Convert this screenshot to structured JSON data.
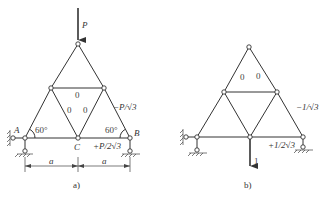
{
  "figure_a": {
    "caption": "a)",
    "load_label": "P",
    "node_labels": {
      "A": "A",
      "B": "B",
      "C": "C"
    },
    "angle_left": "60°",
    "angle_right": "60°",
    "zero_members": [
      "0",
      "0",
      "0"
    ],
    "force_right_upper": "−P/√3",
    "force_bottom_right": "+P/2√3",
    "dim_left": "a",
    "dim_right": "a"
  },
  "figure_b": {
    "caption": "b)",
    "unit_load_label": "1",
    "zero_members": [
      "0",
      "0"
    ],
    "force_right_upper": "−1/√3",
    "force_bottom_right": "+1/2√3"
  },
  "colors": {
    "line": "#333333",
    "background": "#ffffff"
  }
}
